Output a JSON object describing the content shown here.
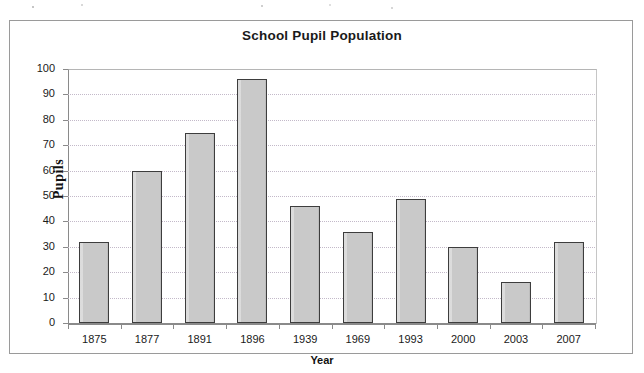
{
  "chart_data": {
    "type": "bar",
    "title": "School Pupil Population",
    "xlabel": "Year",
    "ylabel": "Pupils",
    "categories": [
      "1875",
      "1877",
      "1891",
      "1896",
      "1939",
      "1969",
      "1993",
      "2000",
      "2003",
      "2007"
    ],
    "values": [
      32,
      60,
      75,
      96,
      46,
      36,
      49,
      30,
      16,
      32
    ],
    "ylim": [
      0,
      100
    ],
    "ytick_step": 10,
    "yticks": [
      "100",
      "90",
      "80",
      "70",
      "60",
      "50",
      "40",
      "30",
      "20",
      "10",
      "0"
    ],
    "grid": "horizontal-dotted",
    "legend": "none",
    "series": [
      {
        "name": "Pupils",
        "values": [
          32,
          60,
          75,
          96,
          46,
          36,
          49,
          30,
          16,
          32
        ]
      }
    ],
    "colors": {
      "bar_fill": "#c9c9c9",
      "bar_border": "#3d3d3d",
      "gridline": "#c3b9c9",
      "axis": "#8a8a8a",
      "text": "#1a1a1a",
      "frame": "#9a9a9a",
      "background": "#ffffff"
    }
  }
}
